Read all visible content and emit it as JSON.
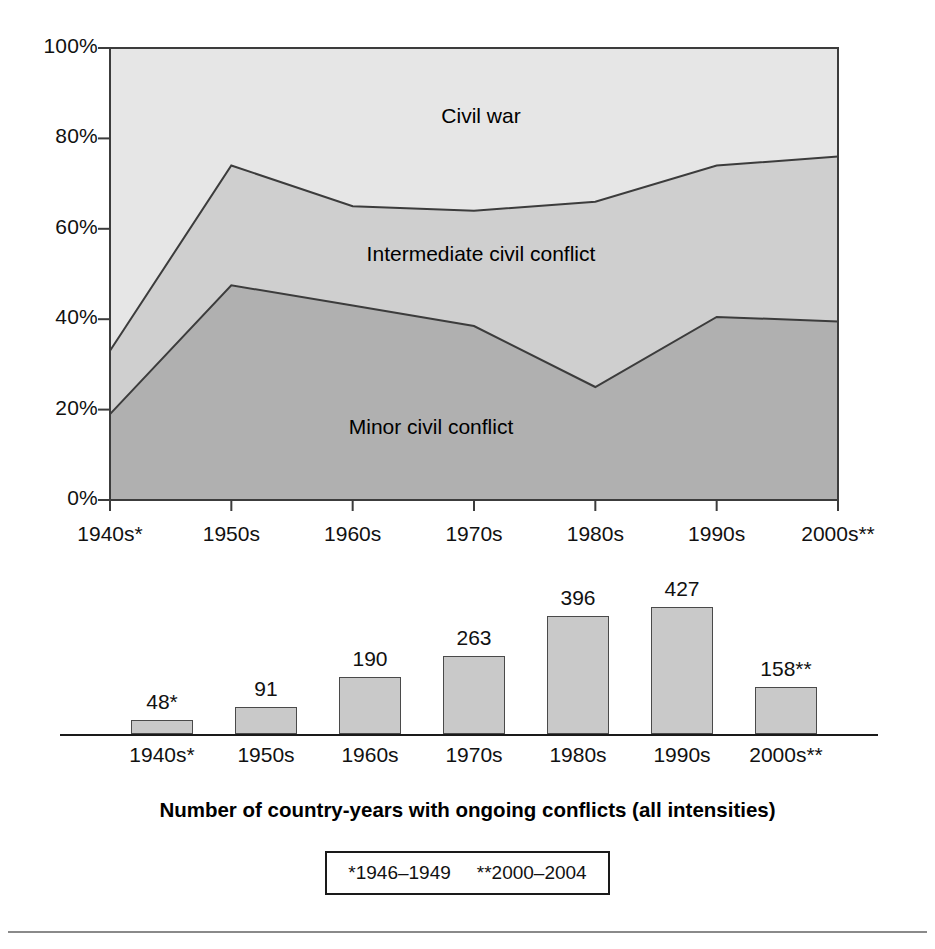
{
  "chart_data": [
    {
      "type": "area",
      "stacked": true,
      "percent_stacked": true,
      "title": "",
      "xlabel": "",
      "ylabel": "",
      "ylim": [
        0,
        100
      ],
      "ytick_labels": [
        "0%",
        "20%",
        "40%",
        "60%",
        "80%",
        "100%"
      ],
      "ytick_values": [
        0,
        20,
        40,
        60,
        80,
        100
      ],
      "grid": false,
      "legend": "inline-labels",
      "categories": [
        "1940s*",
        "1950s",
        "1960s",
        "1970s",
        "1980s",
        "1990s",
        "2000s**"
      ],
      "series": [
        {
          "name": "Minor civil conflict",
          "label": "Minor civil conflict",
          "color": "#b0b0b0",
          "values": [
            19,
            47.5,
            43,
            38.5,
            25,
            40.5,
            39.5
          ]
        },
        {
          "name": "Intermediate civil conflict",
          "label": "Intermediate civil conflict",
          "color": "#cfcfcf",
          "values": [
            14,
            26.5,
            22,
            25.5,
            41,
            33.5,
            36.5
          ]
        },
        {
          "name": "Civil war",
          "label": "Civil war",
          "color": "#e6e6e6",
          "values": [
            67,
            26,
            35,
            36,
            34,
            26,
            24
          ]
        }
      ],
      "cumulative_upper_boundaries": {
        "minor_civil_conflict": [
          19,
          47.5,
          43,
          38.5,
          25,
          40.5,
          39.5
        ],
        "intermediate_civil_conflict": [
          33,
          74,
          65,
          64,
          66,
          74,
          76
        ]
      }
    },
    {
      "type": "bar",
      "title": "Number of country-years with ongoing conflicts (all intensities)",
      "xlabel": "",
      "ylabel": "",
      "categories": [
        "1940s*",
        "1950s",
        "1960s",
        "1970s",
        "1980s",
        "1990s",
        "2000s**"
      ],
      "values": [
        48,
        91,
        190,
        263,
        396,
        427,
        158
      ],
      "value_labels": [
        "48*",
        "91",
        "190",
        "263",
        "396",
        "427",
        "158**"
      ],
      "bar_color": "#c9c9c9",
      "bar_border_color": "#4a4a4a",
      "ylim": [
        0,
        470
      ],
      "grid": false
    }
  ],
  "area_chart": {
    "y_ticks": [
      {
        "label": "100%",
        "value": 100
      },
      {
        "label": "80%",
        "value": 80
      },
      {
        "label": "60%",
        "value": 60
      },
      {
        "label": "40%",
        "value": 40
      },
      {
        "label": "20%",
        "value": 20
      },
      {
        "label": "0%",
        "value": 0
      }
    ],
    "x_ticks": [
      {
        "label": "1940s*"
      },
      {
        "label": "1950s"
      },
      {
        "label": "1960s"
      },
      {
        "label": "1970s"
      },
      {
        "label": "1980s"
      },
      {
        "label": "1990s"
      },
      {
        "label": "2000s**"
      }
    ],
    "band_labels": [
      {
        "label": "Civil war"
      },
      {
        "label": "Intermediate civil conflict"
      },
      {
        "label": "Minor civil conflict"
      }
    ]
  },
  "bar_chart": {
    "bars": [
      {
        "value_label": "48*",
        "x_label": "1940s*",
        "value": 48
      },
      {
        "value_label": "91",
        "x_label": "1950s",
        "value": 91
      },
      {
        "value_label": "190",
        "x_label": "1960s",
        "value": 190
      },
      {
        "value_label": "263",
        "x_label": "1970s",
        "value": 263
      },
      {
        "value_label": "396",
        "x_label": "1980s",
        "value": 396
      },
      {
        "value_label": "427",
        "x_label": "1990s",
        "value": 427
      },
      {
        "value_label": "158**",
        "x_label": "2000s**",
        "value": 158
      }
    ]
  },
  "caption": {
    "text": "Number of country-years with ongoing conflicts (all intensities)"
  },
  "footnote": {
    "items": [
      {
        "text": "*1946–1949"
      },
      {
        "text": "**2000–2004"
      }
    ]
  },
  "colors": {
    "civil_war": "#e6e6e6",
    "intermediate_civil_conflict": "#cfcfcf",
    "minor_civil_conflict": "#b0b0b0",
    "bar_fill": "#c9c9c9",
    "outline": "#4a4a4a"
  }
}
